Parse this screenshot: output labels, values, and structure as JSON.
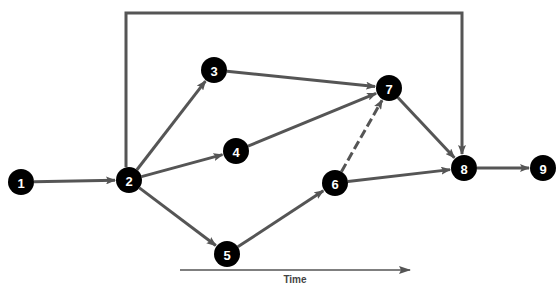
{
  "diagram": {
    "type": "network-activity-diagram",
    "nodes": [
      {
        "id": "1",
        "label": "1",
        "x": 21,
        "y": 182
      },
      {
        "id": "2",
        "label": "2",
        "x": 129,
        "y": 180
      },
      {
        "id": "3",
        "label": "3",
        "x": 214,
        "y": 70
      },
      {
        "id": "4",
        "label": "4",
        "x": 236,
        "y": 151
      },
      {
        "id": "5",
        "label": "5",
        "x": 227,
        "y": 254
      },
      {
        "id": "6",
        "label": "6",
        "x": 335,
        "y": 183
      },
      {
        "id": "7",
        "label": "7",
        "x": 389,
        "y": 88
      },
      {
        "id": "8",
        "label": "8",
        "x": 464,
        "y": 168
      },
      {
        "id": "9",
        "label": "9",
        "x": 543,
        "y": 168
      }
    ],
    "edges": [
      {
        "from": "1",
        "to": "2",
        "style": "solid"
      },
      {
        "from": "2",
        "to": "3",
        "style": "solid"
      },
      {
        "from": "2",
        "to": "4",
        "style": "solid"
      },
      {
        "from": "2",
        "to": "5",
        "style": "solid"
      },
      {
        "from": "3",
        "to": "7",
        "style": "solid"
      },
      {
        "from": "4",
        "to": "7",
        "style": "solid"
      },
      {
        "from": "5",
        "to": "6",
        "style": "solid"
      },
      {
        "from": "6",
        "to": "7",
        "style": "dashed"
      },
      {
        "from": "6",
        "to": "8",
        "style": "solid"
      },
      {
        "from": "7",
        "to": "8",
        "style": "solid"
      },
      {
        "from": "2",
        "to": "8",
        "style": "solid",
        "routed": "over-top"
      },
      {
        "from": "8",
        "to": "9",
        "style": "solid"
      }
    ],
    "time_axis": {
      "label": "Time",
      "x1": 180,
      "x2": 410,
      "y": 270
    },
    "colors": {
      "node_fill": "#000000",
      "node_text": "#ffffff",
      "edge": "#555555"
    }
  }
}
